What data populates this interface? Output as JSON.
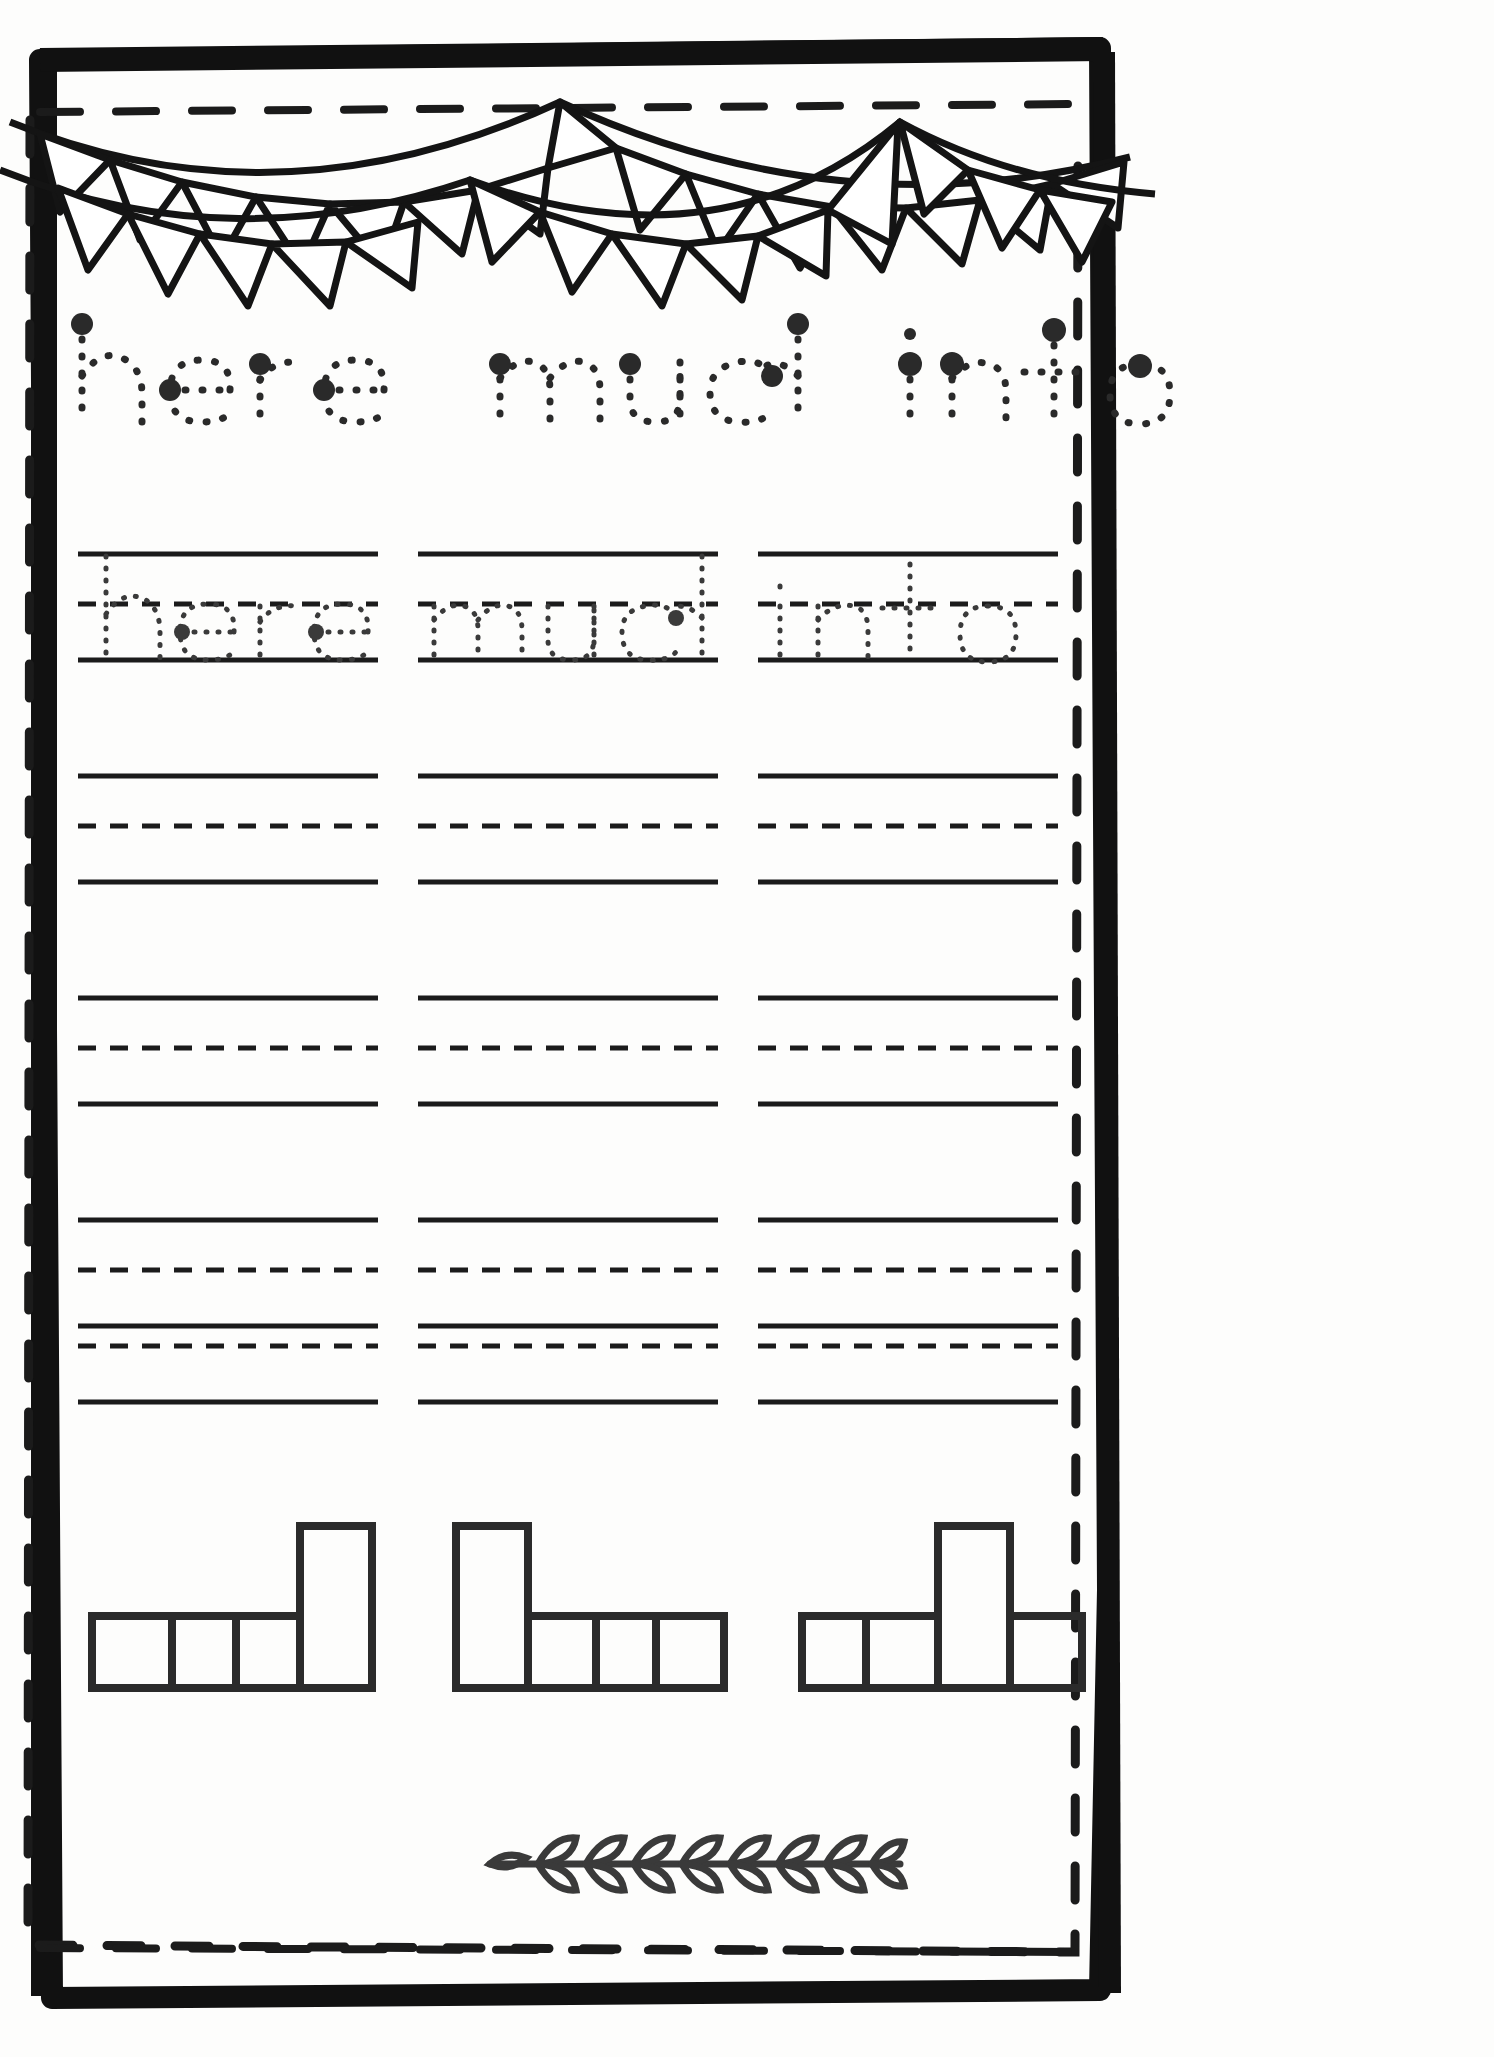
{
  "worksheet": {
    "type": "handwriting-tracing-worksheet",
    "ink_color": "#1b1b1b",
    "paper_color": "#fdfdfc",
    "title_words": [
      "here",
      "much",
      "into"
    ],
    "trace_words": [
      "here",
      "much",
      "into"
    ],
    "columns": 3,
    "practice_rows": 5,
    "traced_row_index": 0,
    "line_style": {
      "top": "solid",
      "middle": "dashed",
      "bottom": "solid"
    },
    "decorations": {
      "top": "bunting-banner",
      "bottom": "leaf-vine",
      "border": "hand-drawn-frame-with-dashed-inner-line"
    }
  },
  "header": {
    "word_1": "here",
    "word_2": "much",
    "word_3": "into"
  },
  "practice": {
    "column_1_word": "here",
    "column_2_word": "much",
    "column_3_word": "into",
    "row_labels": [
      "row-1-traced",
      "row-2-blank",
      "row-3-blank",
      "row-4-blank",
      "row-5-blank"
    ]
  },
  "word_shapes": {
    "caption": "word shape boxes",
    "groups": [
      {
        "word": "here",
        "pattern": [
          "short",
          "short",
          "short",
          "tall"
        ]
      },
      {
        "word": "much",
        "pattern": [
          "tall",
          "short",
          "short",
          "short"
        ]
      },
      {
        "word": "into",
        "pattern": [
          "short",
          "short",
          "tall",
          "short"
        ]
      }
    ]
  },
  "vine": {
    "leaf_pairs": 8
  },
  "banner": {
    "swags": 2,
    "flags_swag_1": 11,
    "flags_swag_2": 11
  }
}
